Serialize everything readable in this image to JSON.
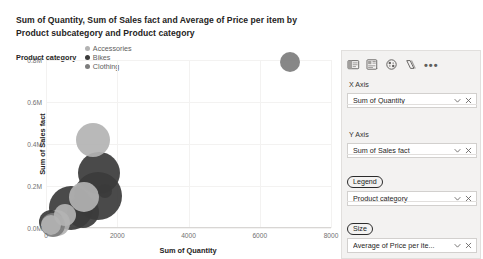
{
  "chart": {
    "title": "Sum of Quantity, Sum of Sales fact and Average of Price per item by Product subcategory and Product category",
    "legend_title": "Product category",
    "legend": [
      {
        "label": "Accessories",
        "color": "#B3B3B3"
      },
      {
        "label": "Bikes",
        "color": "#3B3B3B"
      },
      {
        "label": "Clothing",
        "color": "#7D7D7D"
      }
    ]
  },
  "chart_data": {
    "type": "scatter",
    "title": "Sum of Quantity, Sum of Sales fact and Average of Price per item by Product subcategory and Product category",
    "xlabel": "Sum of Quantity",
    "ylabel": "Sum of Sales fact",
    "xlim": [
      0,
      8000
    ],
    "ylim": [
      0,
      800000
    ],
    "xticks": [
      0,
      2000,
      4000,
      6000,
      8000
    ],
    "xticklabels": [
      "0",
      "2000",
      "4000",
      "6000",
      "8000"
    ],
    "yticks": [
      0,
      200000,
      400000,
      600000,
      800000
    ],
    "yticklabels": [
      "0.0M",
      "0.2M",
      "0.4M",
      "0.6M",
      "0.8M"
    ],
    "grid": true,
    "legend_position": "top-left",
    "size_field": "Average of Price per item",
    "series": [
      {
        "name": "Accessories",
        "color": "#B3B3B3",
        "points": [
          {
            "x": 150,
            "y": 12000,
            "size": 10
          },
          {
            "x": 300,
            "y": 22000,
            "size": 13
          },
          {
            "x": 520,
            "y": 60000,
            "size": 11
          },
          {
            "x": 1060,
            "y": 150000,
            "size": 15
          },
          {
            "x": 1320,
            "y": 420000,
            "size": 17
          }
        ]
      },
      {
        "name": "Bikes",
        "color": "#3B3B3B",
        "points": [
          {
            "x": 130,
            "y": 30000,
            "size": 12
          },
          {
            "x": 690,
            "y": 95000,
            "size": 22
          },
          {
            "x": 1040,
            "y": 78000,
            "size": 16
          },
          {
            "x": 1460,
            "y": 152000,
            "size": 24
          },
          {
            "x": 1480,
            "y": 262000,
            "size": 21
          },
          {
            "x": 1660,
            "y": 175000,
            "size": 7
          }
        ]
      },
      {
        "name": "Clothing",
        "color": "#7D7D7D",
        "points": [
          {
            "x": 210,
            "y": 16000,
            "size": 12
          },
          {
            "x": 6850,
            "y": 790000,
            "size": 10
          }
        ]
      }
    ]
  },
  "pane": {
    "toolbar": [
      {
        "name": "fields-icon"
      },
      {
        "name": "format-icon"
      },
      {
        "name": "analytics-icon"
      },
      {
        "name": "drill-icon"
      },
      {
        "name": "more-options-icon",
        "label": "•••"
      }
    ],
    "wells": [
      {
        "label": "X Axis",
        "highlight": false,
        "value": "Sum of Quantity"
      },
      {
        "label": "Y Axis",
        "highlight": false,
        "value": "Sum of Sales fact"
      },
      {
        "label": "Legend",
        "highlight": true,
        "value": "Product category"
      },
      {
        "label": "Size",
        "highlight": true,
        "value": "Average of Price per ite..."
      }
    ],
    "chip_dropdown_icon": "chevron-down-icon",
    "chip_remove_icon": "close-icon"
  }
}
